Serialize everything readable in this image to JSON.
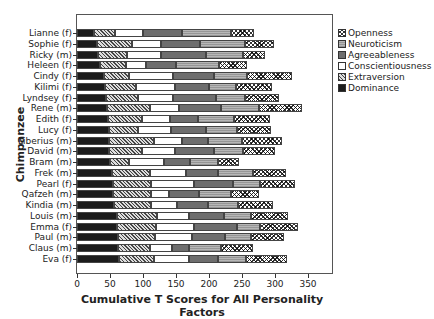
{
  "chart_data": {
    "type": "bar",
    "orientation": "horizontal",
    "stacked": true,
    "title": "",
    "xlabel": "Cumulative T Scores for All Personality Factors",
    "ylabel": "Chimpanzee",
    "xlim": [
      0,
      385
    ],
    "xticks": [
      0,
      50,
      100,
      150,
      200,
      250,
      300,
      350
    ],
    "grid": false,
    "legend_position": "right",
    "categories": [
      "Lianne (f)",
      "Sophie (f)",
      "Ricky (m)",
      "Heleen (f)",
      "Cindy (f)",
      "Kilimi (f)",
      "Lyndsey (f)",
      "Rene (m)",
      "Edith (f)",
      "Lucy (f)",
      "Liberius (m)",
      "David (m)",
      "Bram (m)",
      "Frek (m)",
      "Pearl (f)",
      "Qafzeh (m)",
      "Kindia (m)",
      "Louis (m)",
      "Emma (f)",
      "Paul (m)",
      "Claus (m)",
      "Eva (f)"
    ],
    "series": [
      {
        "name": "Dominance",
        "values": [
          25,
          30,
          32,
          35,
          41,
          43,
          44,
          46,
          47,
          48,
          48,
          49,
          50,
          53,
          54,
          54,
          56,
          60,
          61,
          62,
          62,
          64
        ]
      },
      {
        "name": "Extraversion",
        "values": [
          32,
          53,
          44,
          39,
          38,
          46,
          49,
          64,
          52,
          45,
          69,
          49,
          29,
          57,
          58,
          58,
          56,
          61,
          58,
          56,
          48,
          52
        ]
      },
      {
        "name": "Conscientiousness",
        "values": [
          43,
          44,
          51,
          31,
          67,
          59,
          53,
          45,
          42,
          50,
          42,
          50,
          53,
          55,
          65,
          28,
          39,
          48,
          59,
          57,
          34,
          53
        ]
      },
      {
        "name": "Agreeableness",
        "values": [
          59,
          60,
          68,
          45,
          62,
          52,
          64,
          63,
          42,
          52,
          40,
          60,
          40,
          48,
          59,
          45,
          48,
          54,
          65,
          50,
          26,
          45
        ]
      },
      {
        "name": "Neuroticism",
        "values": [
          74,
          67,
          57,
          65,
          49,
          41,
          44,
          58,
          55,
          48,
          51,
          43,
          41,
          53,
          41,
          48,
          45,
          41,
          35,
          38,
          48,
          42
        ]
      },
      {
        "name": "Openness",
        "values": [
          35,
          44,
          33,
          43,
          69,
          55,
          52,
          65,
          55,
          51,
          61,
          49,
          32,
          51,
          54,
          43,
          53,
          56,
          57,
          50,
          48,
          62
        ]
      }
    ]
  },
  "legend": [
    {
      "label": "Openness",
      "key": "opn"
    },
    {
      "label": "Neuroticism",
      "key": "neu"
    },
    {
      "label": "Agreeableness",
      "key": "agr"
    },
    {
      "label": "Conscientiousness",
      "key": "con"
    },
    {
      "label": "Extraversion",
      "key": "ext"
    },
    {
      "label": "Dominance",
      "key": "dom"
    }
  ]
}
